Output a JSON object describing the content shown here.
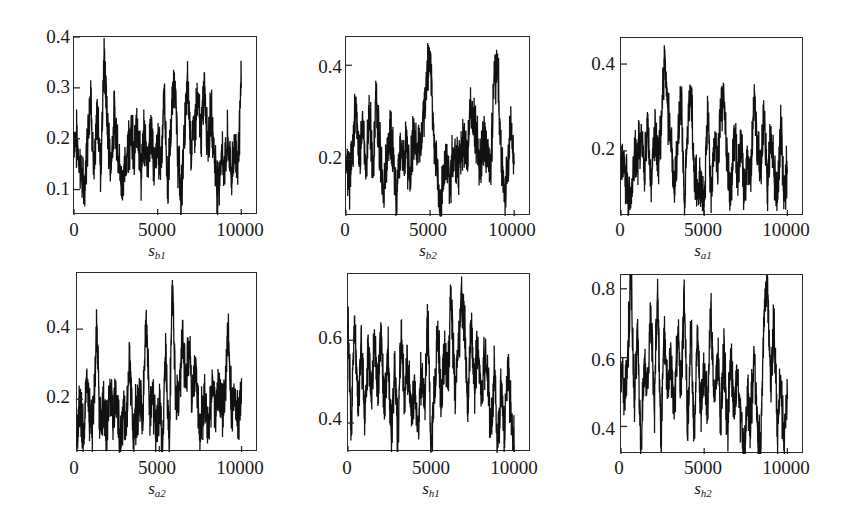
{
  "chart_data": [
    {
      "type": "line",
      "title": "",
      "xlabel": "s_b1",
      "xlabel_base": "s",
      "xlabel_sub": "b1",
      "ylabel": "",
      "xlim": [
        0,
        11000
      ],
      "ylim": [
        0.05,
        0.4
      ],
      "xticks": [
        0,
        5000,
        10000
      ],
      "yticks": [
        0.1,
        0.2,
        0.3,
        0.4
      ],
      "ytick_labels": [
        "0.1",
        "0.2",
        "0.3",
        "0.4"
      ],
      "xtick_labels": [
        "0",
        "5000",
        "10000"
      ],
      "grid": false,
      "legend": "none",
      "x": [
        0,
        200,
        400,
        600,
        800,
        1000,
        1200,
        1400,
        1600,
        1800,
        2000,
        2200,
        2400,
        2600,
        2800,
        3000,
        3200,
        3400,
        3600,
        3800,
        4000,
        4200,
        4400,
        4600,
        4800,
        5000,
        5200,
        5400,
        5600,
        5800,
        6000,
        6200,
        6400,
        6600,
        6800,
        7000,
        7200,
        7400,
        7600,
        7800,
        8000,
        8200,
        8400,
        8600,
        8800,
        9000,
        9200,
        9400,
        9600,
        9800,
        10000
      ],
      "values": [
        0.21,
        0.19,
        0.14,
        0.09,
        0.2,
        0.3,
        0.12,
        0.26,
        0.14,
        0.37,
        0.22,
        0.15,
        0.24,
        0.2,
        0.11,
        0.13,
        0.18,
        0.22,
        0.16,
        0.24,
        0.13,
        0.2,
        0.16,
        0.22,
        0.14,
        0.19,
        0.16,
        0.29,
        0.1,
        0.22,
        0.33,
        0.17,
        0.08,
        0.21,
        0.31,
        0.18,
        0.22,
        0.28,
        0.2,
        0.31,
        0.19,
        0.25,
        0.17,
        0.1,
        0.17,
        0.14,
        0.2,
        0.13,
        0.18,
        0.16,
        0.3
      ]
    },
    {
      "type": "line",
      "title": "",
      "xlabel": "s_b2",
      "xlabel_base": "s",
      "xlabel_sub": "b2",
      "ylabel": "",
      "xlim": [
        0,
        11000
      ],
      "ylim": [
        0.08,
        0.46
      ],
      "xticks": [
        0,
        5000,
        10000
      ],
      "yticks": [
        0.2,
        0.4
      ],
      "ytick_labels": [
        "0.2",
        "0.4"
      ],
      "xtick_labels": [
        "0",
        "5000",
        "10000"
      ],
      "grid": false,
      "legend": "none",
      "x": [
        0,
        200,
        400,
        600,
        800,
        1000,
        1200,
        1400,
        1600,
        1800,
        2000,
        2200,
        2400,
        2600,
        2800,
        3000,
        3200,
        3400,
        3600,
        3800,
        4000,
        4200,
        4400,
        4600,
        4800,
        5000,
        5200,
        5400,
        5600,
        5800,
        6000,
        6200,
        6400,
        6600,
        6800,
        7000,
        7200,
        7400,
        7600,
        7800,
        8000,
        8200,
        8400,
        8600,
        8800,
        9000,
        9200,
        9400,
        9600,
        9800,
        10000
      ],
      "values": [
        0.2,
        0.15,
        0.23,
        0.33,
        0.19,
        0.27,
        0.18,
        0.3,
        0.16,
        0.34,
        0.22,
        0.13,
        0.18,
        0.26,
        0.2,
        0.12,
        0.22,
        0.19,
        0.24,
        0.14,
        0.27,
        0.21,
        0.23,
        0.28,
        0.38,
        0.43,
        0.25,
        0.19,
        0.09,
        0.16,
        0.2,
        0.14,
        0.22,
        0.18,
        0.21,
        0.25,
        0.2,
        0.32,
        0.27,
        0.23,
        0.18,
        0.25,
        0.2,
        0.16,
        0.38,
        0.4,
        0.24,
        0.12,
        0.18,
        0.28,
        0.19
      ]
    },
    {
      "type": "line",
      "title": "",
      "xlabel": "s_a1",
      "xlabel_base": "s",
      "xlabel_sub": "a1",
      "ylabel": "",
      "xlim": [
        0,
        11000
      ],
      "ylim": [
        0.05,
        0.46
      ],
      "xticks": [
        0,
        5000,
        10000
      ],
      "yticks": [
        0.2,
        0.4
      ],
      "ytick_labels": [
        "0.2",
        "0.4"
      ],
      "xtick_labels": [
        "0",
        "5000",
        "10000"
      ],
      "grid": false,
      "legend": "none",
      "x": [
        0,
        200,
        400,
        600,
        800,
        1000,
        1200,
        1400,
        1600,
        1800,
        2000,
        2200,
        2400,
        2600,
        2800,
        3000,
        3200,
        3400,
        3600,
        3800,
        4000,
        4200,
        4400,
        4600,
        4800,
        5000,
        5200,
        5400,
        5600,
        5800,
        6000,
        6200,
        6400,
        6600,
        6800,
        7000,
        7200,
        7400,
        7600,
        7800,
        8000,
        8200,
        8400,
        8600,
        8800,
        9000,
        9200,
        9400,
        9600,
        9800,
        10000
      ],
      "values": [
        0.18,
        0.16,
        0.12,
        0.09,
        0.2,
        0.18,
        0.23,
        0.15,
        0.27,
        0.12,
        0.24,
        0.18,
        0.26,
        0.42,
        0.3,
        0.2,
        0.11,
        0.22,
        0.34,
        0.08,
        0.24,
        0.35,
        0.15,
        0.11,
        0.13,
        0.07,
        0.3,
        0.12,
        0.22,
        0.16,
        0.3,
        0.31,
        0.18,
        0.11,
        0.25,
        0.14,
        0.22,
        0.09,
        0.18,
        0.14,
        0.32,
        0.2,
        0.16,
        0.29,
        0.13,
        0.24,
        0.17,
        0.08,
        0.27,
        0.11,
        0.15
      ]
    },
    {
      "type": "line",
      "title": "",
      "xlabel": "s_a2",
      "xlabel_base": "s",
      "xlabel_sub": "a2",
      "ylabel": "",
      "xlim": [
        0,
        11000
      ],
      "ylim": [
        0.05,
        0.56
      ],
      "xticks": [
        0,
        5000,
        10000
      ],
      "yticks": [
        0.2,
        0.4
      ],
      "ytick_labels": [
        "0.2",
        "0.4"
      ],
      "xtick_labels": [
        "0",
        "5000",
        "10000"
      ],
      "grid": false,
      "legend": "none",
      "x": [
        0,
        200,
        400,
        600,
        800,
        1000,
        1200,
        1400,
        1600,
        1800,
        2000,
        2200,
        2400,
        2600,
        2800,
        3000,
        3200,
        3400,
        3600,
        3800,
        4000,
        4200,
        4400,
        4600,
        4800,
        5000,
        5200,
        5400,
        5600,
        5800,
        6000,
        6200,
        6400,
        6600,
        6800,
        7000,
        7200,
        7400,
        7600,
        7800,
        8000,
        8200,
        8400,
        8600,
        8800,
        9000,
        9200,
        9400,
        9600,
        9800,
        10000
      ],
      "values": [
        0.1,
        0.17,
        0.08,
        0.28,
        0.12,
        0.15,
        0.42,
        0.11,
        0.19,
        0.09,
        0.25,
        0.15,
        0.2,
        0.08,
        0.18,
        0.14,
        0.32,
        0.1,
        0.17,
        0.2,
        0.14,
        0.44,
        0.16,
        0.2,
        0.12,
        0.18,
        0.09,
        0.32,
        0.06,
        0.54,
        0.18,
        0.22,
        0.38,
        0.27,
        0.36,
        0.2,
        0.3,
        0.12,
        0.15,
        0.2,
        0.1,
        0.24,
        0.16,
        0.25,
        0.18,
        0.22,
        0.42,
        0.15,
        0.2,
        0.13,
        0.26
      ]
    },
    {
      "type": "line",
      "title": "",
      "xlabel": "s_h1",
      "xlabel_base": "s",
      "xlabel_sub": "h1",
      "ylabel": "",
      "xlim": [
        0,
        11000
      ],
      "ylim": [
        0.33,
        0.76
      ],
      "xticks": [
        0,
        5000,
        10000
      ],
      "yticks": [
        0.4,
        0.6
      ],
      "ytick_labels": [
        "0.4",
        "0.6"
      ],
      "xtick_labels": [
        "0",
        "5000",
        "10000"
      ],
      "grid": false,
      "legend": "none",
      "x": [
        0,
        200,
        400,
        600,
        800,
        1000,
        1200,
        1400,
        1600,
        1800,
        2000,
        2200,
        2400,
        2600,
        2800,
        3000,
        3200,
        3400,
        3600,
        3800,
        4000,
        4200,
        4400,
        4600,
        4800,
        5000,
        5200,
        5400,
        5600,
        5800,
        6000,
        6200,
        6400,
        6600,
        6800,
        7000,
        7200,
        7400,
        7600,
        7800,
        8000,
        8200,
        8400,
        8600,
        8800,
        9000,
        9200,
        9400,
        9600,
        9800,
        10000
      ],
      "values": [
        0.62,
        0.4,
        0.66,
        0.43,
        0.6,
        0.4,
        0.58,
        0.45,
        0.61,
        0.48,
        0.63,
        0.42,
        0.58,
        0.36,
        0.55,
        0.37,
        0.62,
        0.45,
        0.54,
        0.42,
        0.5,
        0.38,
        0.52,
        0.45,
        0.65,
        0.34,
        0.47,
        0.62,
        0.44,
        0.56,
        0.5,
        0.73,
        0.48,
        0.55,
        0.7,
        0.66,
        0.42,
        0.64,
        0.48,
        0.59,
        0.44,
        0.56,
        0.5,
        0.38,
        0.52,
        0.35,
        0.5,
        0.37,
        0.53,
        0.45,
        0.34
      ]
    },
    {
      "type": "line",
      "title": "",
      "xlabel": "s_h2",
      "xlabel_base": "s",
      "xlabel_sub": "h2",
      "ylabel": "",
      "xlim": [
        0,
        11000
      ],
      "ylim": [
        0.32,
        0.84
      ],
      "xticks": [
        0,
        5000,
        10000
      ],
      "yticks": [
        0.4,
        0.6,
        0.8
      ],
      "ytick_labels": [
        "0.4",
        "0.6",
        "0.8"
      ],
      "xtick_labels": [
        "0",
        "5000",
        "10000"
      ],
      "grid": false,
      "legend": "none",
      "x": [
        0,
        200,
        400,
        600,
        800,
        1000,
        1200,
        1400,
        1600,
        1800,
        2000,
        2200,
        2400,
        2600,
        2800,
        3000,
        3200,
        3400,
        3600,
        3800,
        4000,
        4200,
        4400,
        4600,
        4800,
        5000,
        5200,
        5400,
        5600,
        5800,
        6000,
        6200,
        6400,
        6600,
        6800,
        7000,
        7200,
        7400,
        7600,
        7800,
        8000,
        8200,
        8400,
        8600,
        8800,
        9000,
        9200,
        9400,
        9600,
        9800,
        10000
      ],
      "values": [
        0.58,
        0.49,
        0.62,
        0.84,
        0.47,
        0.67,
        0.34,
        0.6,
        0.52,
        0.75,
        0.44,
        0.82,
        0.35,
        0.68,
        0.52,
        0.6,
        0.42,
        0.67,
        0.5,
        0.79,
        0.38,
        0.7,
        0.37,
        0.66,
        0.45,
        0.58,
        0.43,
        0.76,
        0.47,
        0.6,
        0.42,
        0.62,
        0.38,
        0.6,
        0.44,
        0.55,
        0.43,
        0.32,
        0.47,
        0.42,
        0.62,
        0.4,
        0.32,
        0.74,
        0.82,
        0.5,
        0.72,
        0.37,
        0.55,
        0.34,
        0.48
      ]
    }
  ]
}
